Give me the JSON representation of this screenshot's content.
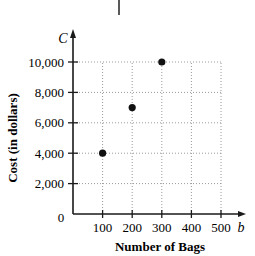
{
  "chart_data": {
    "type": "scatter",
    "title": "",
    "xlabel": "Number of Bags",
    "ylabel": "Cost (in dollars)",
    "x_variable": "b",
    "y_variable": "C",
    "x_ticks": [
      100,
      200,
      300,
      400,
      500
    ],
    "x_tick_labels": [
      "100",
      "200",
      "300",
      "400",
      "500"
    ],
    "y_ticks": [
      2000,
      4000,
      6000,
      8000,
      10000
    ],
    "y_tick_labels": [
      "2,000",
      "4,000",
      "6,000",
      "8,000",
      "10,000"
    ],
    "origin_label": "0",
    "xlim": [
      0,
      500
    ],
    "ylim": [
      0,
      10000
    ],
    "grid": true,
    "grid_style": "dotted",
    "legend": null,
    "series": [
      {
        "name": "Cost",
        "points": [
          {
            "x": 100,
            "y": 4000
          },
          {
            "x": 200,
            "y": 7000
          },
          {
            "x": 300,
            "y": 10000
          }
        ]
      }
    ]
  },
  "colors": {
    "axis": "#1a1a1a",
    "grid": "#9a9a9a",
    "point": "#111111"
  }
}
